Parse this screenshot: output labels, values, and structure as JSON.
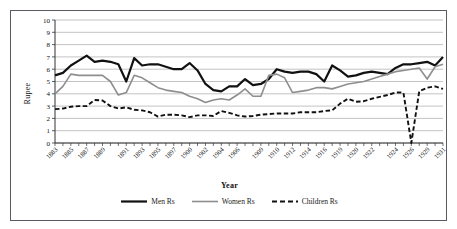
{
  "figure": {
    "partial_title": "",
    "frame_color": "#5a5a63"
  },
  "chart_data": {
    "type": "line",
    "title": "",
    "xlabel": "Year",
    "ylabel": "Rupee",
    "ylim": [
      0,
      10
    ],
    "ytick_labels": [
      "0",
      "1",
      "2",
      "3",
      "4",
      "5",
      "6",
      "7",
      "8",
      "9",
      "10"
    ],
    "grid": true,
    "grid_color": "#9a9a9a",
    "legend_position": "bottom-center",
    "x": [
      1883,
      1884,
      1885,
      1886,
      1887,
      1888,
      1889,
      1890,
      1891,
      1892,
      1893,
      1894,
      1895,
      1896,
      1897,
      1898,
      1899,
      1900,
      1901,
      1902,
      1903,
      1904,
      1905,
      1906,
      1907,
      1908,
      1909,
      1910,
      1911,
      1912,
      1913,
      1914,
      1915,
      1916,
      1917,
      1918,
      1919,
      1920,
      1921,
      1922,
      1923,
      1924,
      1925,
      1926,
      1927,
      1928,
      1929,
      1930,
      1931,
      1932
    ],
    "xtick_labels": [
      "1883",
      "1885",
      "1887",
      "1889",
      "1891",
      "1893",
      "1895",
      "1897",
      "1900",
      "1902",
      "1904",
      "1906",
      "1909",
      "1910",
      "1912",
      "1914",
      "1916",
      "1919",
      "1920",
      "1922",
      "1924",
      "1926",
      "1929",
      "1931"
    ],
    "series": [
      {
        "name": "Men Rs",
        "color": "#111111",
        "style": "solid",
        "width": 2.2,
        "values": [
          5.5,
          5.7,
          6.3,
          6.7,
          7.1,
          6.6,
          6.7,
          6.6,
          6.4,
          5.0,
          6.9,
          6.3,
          6.4,
          6.4,
          6.2,
          6.0,
          6.0,
          6.5,
          5.9,
          4.8,
          4.3,
          4.2,
          4.6,
          4.6,
          5.2,
          4.7,
          4.8,
          5.2,
          6.0,
          5.8,
          5.7,
          5.8,
          5.8,
          5.6,
          5.0,
          6.3,
          5.9,
          5.4,
          5.5,
          5.7,
          5.8,
          5.7,
          5.6,
          6.1,
          6.4,
          6.4,
          6.5,
          6.6,
          6.3,
          7.0
        ]
      },
      {
        "name": "Women Rs",
        "color": "#8e8e8e",
        "style": "solid",
        "width": 1.6,
        "values": [
          4.0,
          4.6,
          5.6,
          5.5,
          5.5,
          5.5,
          5.5,
          5.0,
          3.9,
          4.1,
          5.5,
          5.3,
          4.9,
          4.5,
          4.3,
          4.2,
          4.1,
          3.8,
          3.6,
          3.3,
          3.5,
          3.6,
          3.5,
          3.9,
          4.4,
          3.8,
          3.8,
          5.5,
          5.6,
          5.3,
          4.1,
          4.2,
          4.3,
          4.5,
          4.5,
          4.4,
          4.6,
          4.8,
          4.9,
          5.0,
          5.2,
          5.4,
          5.6,
          5.8,
          5.9,
          6.0,
          6.1,
          5.2,
          6.2,
          6.4
        ]
      },
      {
        "name": "Children Rs",
        "color": "#111111",
        "style": "dashed",
        "width": 1.9,
        "values": [
          2.75,
          2.8,
          2.95,
          3.0,
          3.0,
          3.5,
          3.45,
          3.0,
          2.8,
          2.9,
          2.7,
          2.65,
          2.5,
          2.15,
          2.3,
          2.3,
          2.25,
          2.1,
          2.25,
          2.25,
          2.2,
          2.6,
          2.45,
          2.25,
          2.15,
          2.2,
          2.3,
          2.35,
          2.4,
          2.4,
          2.4,
          2.5,
          2.5,
          2.5,
          2.6,
          2.65,
          3.2,
          3.6,
          3.35,
          3.4,
          3.6,
          3.75,
          3.9,
          4.1,
          4.1,
          0.0,
          4.2,
          4.5,
          4.6,
          4.4
        ]
      }
    ],
    "annotations": [
      {
        "series": "Children Rs",
        "year": 1928,
        "note": "sharp drop to 0"
      }
    ]
  },
  "legend": {
    "items": [
      {
        "label": "Men Rs"
      },
      {
        "label": "Women Rs"
      },
      {
        "label": "Children Rs"
      }
    ]
  }
}
